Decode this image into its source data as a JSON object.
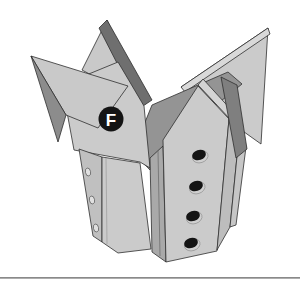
{
  "figure": {
    "kind": "assembly-step-illustration",
    "badge_label": "F",
    "front_hole_count": 4,
    "side_peg_hole_count": 3
  },
  "colors": {
    "background": "#ffffff",
    "face_light": "#cbcbcb",
    "face_light2": "#c9c9c9",
    "edge_highlight": "#d9d9d9",
    "wall_mid": "#c0c0c0",
    "side_strip": "#a9a9a9",
    "roof_dark": "#949494",
    "underside_dark": "#8c8c8c",
    "spike_edge_dark": "#6f6f6f",
    "wedge_dark": "#7f7f7f",
    "outline": "#2e2e2e",
    "badge_fill": "#141414",
    "badge_text": "#ffffff",
    "hole_fill": "#141414",
    "hole_rim": "#cfcfcf",
    "peg_hole_fill": "#e0e0e0",
    "ground_line": "#8a8a8a"
  },
  "ground_line": {
    "visible": true,
    "y": 277
  }
}
